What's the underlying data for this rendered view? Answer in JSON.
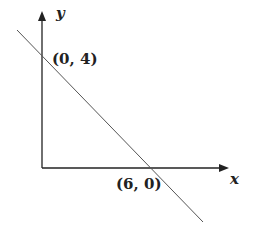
{
  "diagram": {
    "axes": {
      "x_label": "x",
      "y_label": "y"
    },
    "points": [
      {
        "label": "(0, 4)",
        "x": 0,
        "y": 4
      },
      {
        "label": "(6, 0)",
        "x": 6,
        "y": 0
      }
    ],
    "colors": {
      "axis": "#222222",
      "line": "#555555"
    }
  }
}
